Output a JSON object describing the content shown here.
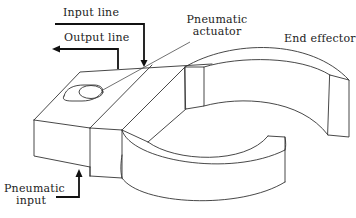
{
  "figure": {
    "type": "mechanical-diagram",
    "stroke_color": "#333333",
    "background_color": "#ffffff"
  },
  "labels": {
    "input_line": "Input line",
    "output_line": "Output line",
    "pneumatic_actuator_1": "Pneumatic",
    "pneumatic_actuator_2": "actuator",
    "end_effector": "End effector",
    "pneumatic_input_1": "Pneumatic",
    "pneumatic_input_2": "input"
  },
  "arrows": [
    {
      "name": "input-line-arrow",
      "direction": "down",
      "points_to": "actuator top"
    },
    {
      "name": "output-line-arrow",
      "direction": "left",
      "points_to": "away from block"
    },
    {
      "name": "pneumatic-input-arrow",
      "direction": "up",
      "points_to": "block underside"
    }
  ]
}
